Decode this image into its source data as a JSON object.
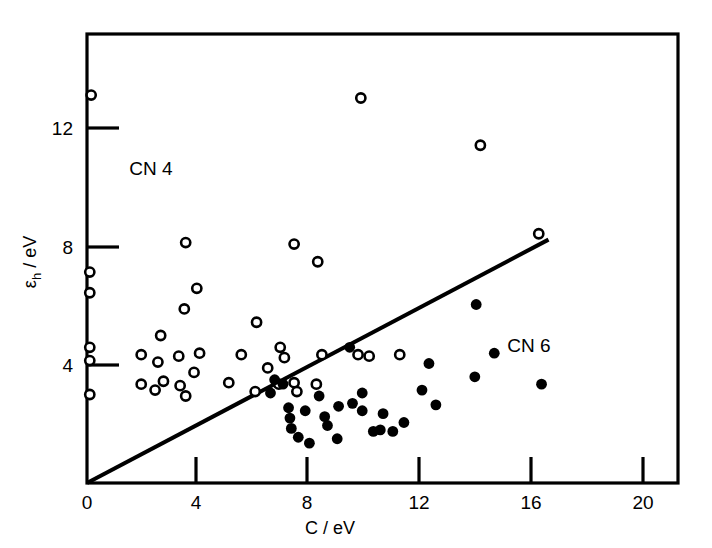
{
  "chart_data": {
    "type": "scatter",
    "title": "",
    "subtitle": "",
    "xlabel": "C / eV",
    "ylabel": "εh / eV",
    "ylabel_base": "ε",
    "ylabel_sub": "h",
    "ylabel_rest": " / eV",
    "xlim": [
      0,
      20
    ],
    "ylim": [
      0,
      14.5
    ],
    "xticks": [
      0,
      4,
      8,
      12,
      16,
      20
    ],
    "xtick_labels": [
      "0",
      "4",
      "8",
      "12",
      "16",
      "20"
    ],
    "yticks": [
      4,
      8,
      12
    ],
    "ytick_labels": [
      "4",
      "8",
      "12"
    ],
    "grid": false,
    "legend_position": "inline-annotations",
    "annotations": [
      {
        "text": "CN 4",
        "x": 2.3,
        "y": 10.45
      },
      {
        "text": "CN 6",
        "x": 15.9,
        "y": 4.45
      }
    ],
    "reference_line": {
      "label": "diagonal reference line",
      "x0": 0.0,
      "y0": 0.0,
      "x1": 16.6,
      "y1": 8.25
    },
    "series": [
      {
        "name": "CN 4",
        "marker": "open-circle",
        "color": "#000000",
        "fill": "#ffffff",
        "points": [
          [
            0.15,
            13.15
          ],
          [
            9.85,
            13.05
          ],
          [
            14.15,
            11.45
          ],
          [
            0.1,
            7.15
          ],
          [
            0.1,
            6.45
          ],
          [
            3.55,
            8.15
          ],
          [
            7.45,
            8.1
          ],
          [
            8.3,
            7.5
          ],
          [
            0.1,
            4.6
          ],
          [
            0.1,
            4.15
          ],
          [
            0.1,
            3.0
          ],
          [
            1.95,
            4.35
          ],
          [
            2.55,
            4.1
          ],
          [
            2.65,
            5.0
          ],
          [
            3.3,
            4.3
          ],
          [
            3.5,
            5.9
          ],
          [
            3.95,
            6.6
          ],
          [
            4.05,
            4.4
          ],
          [
            1.95,
            3.35
          ],
          [
            2.45,
            3.15
          ],
          [
            2.75,
            3.45
          ],
          [
            3.35,
            3.3
          ],
          [
            3.55,
            2.95
          ],
          [
            3.85,
            3.75
          ],
          [
            5.1,
            3.4
          ],
          [
            5.55,
            4.35
          ],
          [
            6.05,
            3.1
          ],
          [
            6.1,
            5.45
          ],
          [
            6.5,
            3.9
          ],
          [
            6.9,
            3.35
          ],
          [
            6.95,
            4.6
          ],
          [
            7.1,
            4.25
          ],
          [
            7.45,
            3.4
          ],
          [
            7.55,
            3.1
          ],
          [
            8.25,
            3.35
          ],
          [
            8.45,
            4.35
          ],
          [
            9.75,
            4.35
          ],
          [
            10.15,
            4.3
          ],
          [
            11.25,
            4.35
          ],
          [
            16.25,
            8.45
          ]
        ]
      },
      {
        "name": "CN 6",
        "marker": "filled-circle",
        "color": "#000000",
        "fill": "#000000",
        "points": [
          [
            6.75,
            3.5
          ],
          [
            7.05,
            3.35
          ],
          [
            6.6,
            3.05
          ],
          [
            7.25,
            2.55
          ],
          [
            7.3,
            2.2
          ],
          [
            7.35,
            1.85
          ],
          [
            7.85,
            2.45
          ],
          [
            7.6,
            1.55
          ],
          [
            8.0,
            1.35
          ],
          [
            8.35,
            2.95
          ],
          [
            8.55,
            2.25
          ],
          [
            8.65,
            1.95
          ],
          [
            9.05,
            2.6
          ],
          [
            9.0,
            1.5
          ],
          [
            9.55,
            2.7
          ],
          [
            9.9,
            3.05
          ],
          [
            9.9,
            2.45
          ],
          [
            9.45,
            4.6
          ],
          [
            10.3,
            1.75
          ],
          [
            10.55,
            1.8
          ],
          [
            10.65,
            2.35
          ],
          [
            11.0,
            1.75
          ],
          [
            11.4,
            2.05
          ],
          [
            12.05,
            3.15
          ],
          [
            12.3,
            4.05
          ],
          [
            12.55,
            2.65
          ],
          [
            13.95,
            3.6
          ],
          [
            14.0,
            6.05
          ],
          [
            14.65,
            4.4
          ],
          [
            16.35,
            3.35
          ]
        ]
      }
    ]
  },
  "axes": {
    "frame_color": "#000000",
    "line_color": "#000000"
  }
}
